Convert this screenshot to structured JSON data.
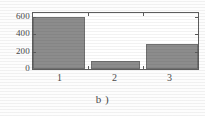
{
  "caption": "b )",
  "chart_data": {
    "type": "bar",
    "title": "",
    "subtitle": "",
    "xlabel": "",
    "ylabel": "",
    "categories": [
      "1",
      "2",
      "3"
    ],
    "values": [
      600,
      90,
      290
    ],
    "ylim": [
      0,
      640
    ],
    "yticks": [
      0,
      200,
      400,
      600
    ],
    "ytick_labels": [
      "0",
      "200",
      "400",
      "600"
    ],
    "grid": false,
    "legend": null,
    "annotations": [],
    "bar_color": "#8c8c8c",
    "bar_edge_color": "#6f6f6f",
    "axis_color": "#5d5d5d",
    "plot_background": "#ffffff",
    "figure_background": "#fdfdfd"
  }
}
